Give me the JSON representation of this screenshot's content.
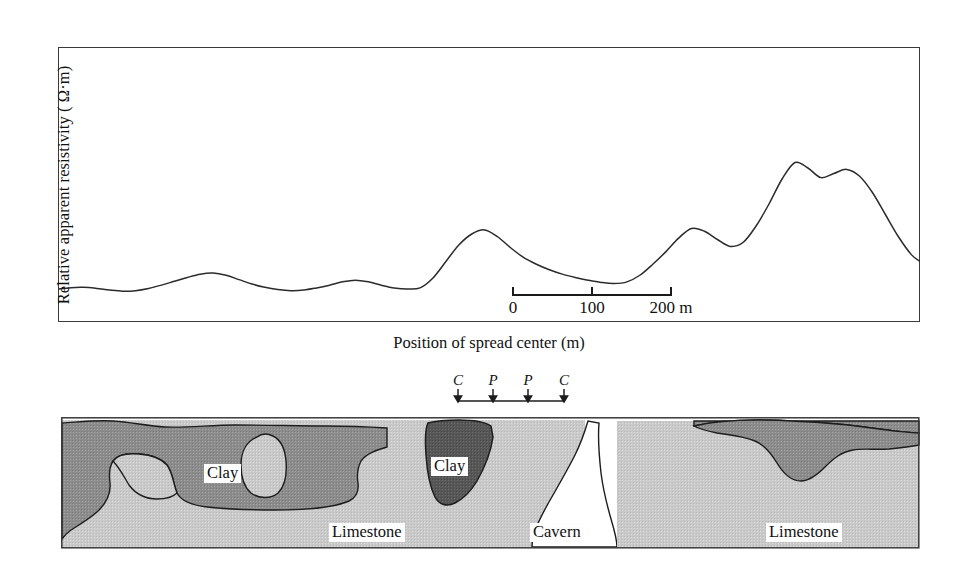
{
  "figure": {
    "domain": "geophysics-resistivity-profile"
  },
  "chart_data": {
    "type": "line",
    "title": "",
    "subtitle": "",
    "xlabel": "Position of spread center (m)",
    "ylabel": "Relative apparent resistivity ( Ω·m)",
    "legend": [],
    "grid": false,
    "axis_ticks_shown": false,
    "xlim": [
      0,
      100
    ],
    "ylim": [
      0,
      100
    ],
    "series": [
      {
        "name": "Relative apparent resistivity",
        "color": "#2b2b2b",
        "x": [
          0,
          1.5,
          3,
          4.5,
          6,
          7.5,
          9,
          10.5,
          12,
          13.5,
          15,
          16.5,
          18,
          19.5,
          21,
          22.5,
          24,
          25.5,
          27,
          28.5,
          30,
          31.5,
          33,
          34.5,
          36,
          37.5,
          39,
          40.5,
          42,
          43.5,
          45,
          46.5,
          48,
          49.5,
          51,
          52.5,
          54,
          55.5,
          57,
          58.5,
          60,
          61.5,
          63,
          64.5,
          66,
          67.5,
          69,
          70.5,
          72,
          73.5,
          75,
          76.5,
          78,
          79.5,
          81,
          82.5,
          84,
          85.5,
          87,
          88.5,
          90,
          91.5,
          93,
          94.5,
          96,
          97.5,
          99,
          100
        ],
        "y": [
          12,
          12.5,
          12.6,
          12.2,
          11.6,
          11.2,
          11.4,
          12.2,
          13.4,
          14.8,
          16.2,
          17.4,
          17.8,
          17.0,
          15.4,
          13.8,
          12.6,
          11.8,
          11.4,
          11.6,
          12.4,
          13.4,
          14.6,
          15.2,
          14.6,
          13.4,
          12.4,
          12.0,
          12.4,
          16.0,
          22.0,
          28.0,
          32.0,
          33.5,
          31.0,
          27.0,
          23.5,
          21.0,
          19.0,
          17.4,
          16.2,
          15.2,
          14.4,
          14.0,
          14.6,
          17.0,
          21.0,
          25.5,
          30.5,
          34.0,
          33.0,
          30.0,
          27.5,
          29.0,
          35.0,
          43.0,
          52.0,
          58.0,
          56.0,
          52.5,
          54.0,
          55.5,
          53.0,
          47.0,
          39.0,
          31.0,
          24.5,
          22.0
        ]
      }
    ],
    "scale_bar": {
      "unit_label": "m",
      "ticks": [
        "0",
        "100",
        "200"
      ],
      "length_m": 200
    },
    "electrode_array": {
      "labels": [
        "C",
        "P",
        "P",
        "C"
      ],
      "description": "four-electrode spread"
    }
  },
  "cross_section": {
    "layers": [
      {
        "key": "clay_shallow",
        "label": "Clay",
        "color": "#8c8c8c"
      },
      {
        "key": "clay_deep_pocket",
        "label": "Clay",
        "color": "#575757"
      },
      {
        "key": "limestone",
        "label": "Limestone",
        "color": "#c9c9c9"
      },
      {
        "key": "cavern",
        "label": "Cavern",
        "color": "#ffffff"
      }
    ],
    "labels": {
      "clay_left": "Clay",
      "clay_pocket": "Clay",
      "limestone_left": "Limestone",
      "limestone_right": "Limestone",
      "cavern": "Cavern"
    }
  },
  "colors": {
    "curve": "#2b2b2b",
    "frame": "#3a3a3a",
    "clay": "#8c8c8c",
    "clay_dark": "#575757",
    "limestone": "#c9c9c9",
    "cavern": "#ffffff",
    "outline": "#1d1d1d"
  }
}
